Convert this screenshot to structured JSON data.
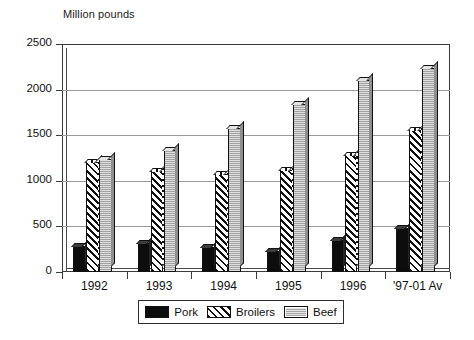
{
  "chart_data": {
    "type": "bar",
    "title": "Million pounds",
    "xlabel": "",
    "ylabel": "",
    "ylim": [
      0,
      2500
    ],
    "yticks": [
      0,
      500,
      1000,
      1500,
      2000,
      2500
    ],
    "grid": true,
    "legend_position": "bottom",
    "categories": [
      "1992",
      "1993",
      "1994",
      "1995",
      "1996",
      "'97-01 Av"
    ],
    "series": [
      {
        "name": "Pork",
        "color": "#0d0d0d",
        "pattern": "solid-black",
        "values": [
          280,
          320,
          270,
          230,
          350,
          480
        ]
      },
      {
        "name": "Broilers",
        "color": "#111111",
        "pattern": "diagonal-hatch",
        "values": [
          1210,
          1110,
          1080,
          1120,
          1280,
          1560
        ]
      },
      {
        "name": "Beef",
        "color": "#b9b9b9",
        "pattern": "light-gray",
        "values": [
          1240,
          1340,
          1580,
          1840,
          2110,
          2240
        ]
      }
    ]
  },
  "legend": {
    "items": [
      {
        "label": "Pork"
      },
      {
        "label": "Broilers"
      },
      {
        "label": "Beef"
      }
    ]
  }
}
